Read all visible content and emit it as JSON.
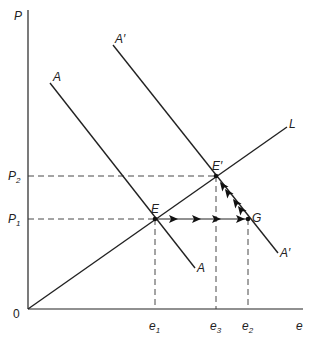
{
  "diagram": {
    "axes": {
      "y_label": "P",
      "x_label": "e",
      "origin_label": "0"
    },
    "y_ticks": [
      {
        "base": "P",
        "sub": "2"
      },
      {
        "base": "P",
        "sub": "1"
      }
    ],
    "x_ticks": [
      {
        "base": "e",
        "sub": "1"
      },
      {
        "base": "e",
        "sub": "3"
      },
      {
        "base": "e",
        "sub": "2"
      }
    ],
    "lines": {
      "L": "L",
      "A_top": "A",
      "A_bottom": "A",
      "A_prime_top": "A′",
      "A_prime_bottom": "A′"
    },
    "points": {
      "E": "E",
      "E_prime": "E′",
      "G": "G"
    },
    "colors": {
      "ink": "#222222",
      "background": "#ffffff"
    }
  }
}
